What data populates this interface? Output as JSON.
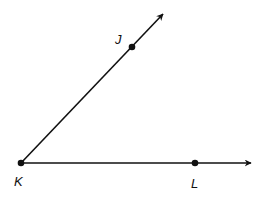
{
  "diagram": {
    "type": "angle",
    "vertex": {
      "label": "K",
      "x": 21,
      "y": 163,
      "label_x": 14,
      "label_y": 186
    },
    "points": [
      {
        "label": "J",
        "x": 132,
        "y": 47,
        "label_x": 115,
        "label_y": 44
      },
      {
        "label": "L",
        "x": 195,
        "y": 163,
        "label_x": 191,
        "label_y": 188
      }
    ],
    "rays": [
      {
        "name": "ray-KJ",
        "from": "K",
        "through": "J",
        "end_x": 163,
        "end_y": 14
      },
      {
        "name": "ray-KL",
        "from": "K",
        "through": "L",
        "end_x": 251,
        "end_y": 163
      }
    ],
    "colors": {
      "stroke": "#111111",
      "background": "#ffffff"
    }
  }
}
